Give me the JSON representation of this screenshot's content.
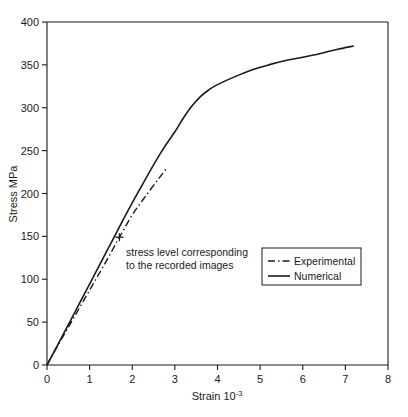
{
  "chart_data": {
    "type": "line",
    "title": "",
    "xlabel": "Strain 10-3",
    "xlabel_base": "Strain 10",
    "xlabel_exponent": "-3",
    "ylabel": "Stress MPa",
    "xlim": [
      0,
      8
    ],
    "ylim": [
      0,
      400
    ],
    "xticks": [
      "0",
      "1",
      "2",
      "3",
      "4",
      "5",
      "6",
      "7",
      "8"
    ],
    "xtick_values": [
      0,
      1,
      2,
      3,
      4,
      5,
      6,
      7,
      8
    ],
    "yticks": [
      "0",
      "50",
      "100",
      "150",
      "200",
      "250",
      "300",
      "350",
      "400"
    ],
    "ytick_values": [
      0,
      50,
      100,
      150,
      200,
      250,
      300,
      350,
      400
    ],
    "grid": false,
    "legend_position": "center-right",
    "series": [
      {
        "name": "Experimental",
        "style": "dash-dot",
        "color": "#1a1a1a",
        "x": [
          0,
          0.2,
          0.5,
          0.8,
          1.1,
          1.4,
          1.7,
          2.0,
          2.3,
          2.6,
          2.8
        ],
        "y": [
          0,
          18,
          44,
          70,
          96,
          122,
          149,
          175,
          196,
          216,
          229
        ]
      },
      {
        "name": "Numerical",
        "style": "solid",
        "color": "#1a1a1a",
        "x": [
          0,
          0.3,
          0.7,
          1.1,
          1.5,
          1.9,
          2.3,
          2.7,
          3.0,
          3.2,
          3.4,
          3.6,
          3.8,
          4.0,
          4.4,
          4.8,
          5.2,
          5.6,
          6.0,
          6.4,
          6.8,
          7.2
        ],
        "y": [
          0,
          28,
          66,
          104,
          142,
          180,
          216,
          250,
          272,
          288,
          302,
          313,
          321,
          327,
          336,
          344,
          350,
          355,
          359,
          363,
          368,
          372
        ]
      }
    ],
    "annotations": [
      {
        "name": "stress-level-note",
        "line1": "stress level corresponding",
        "line2": "to the recorded images",
        "marker": "+",
        "marker_x": 1.7,
        "marker_y": 149
      }
    ]
  },
  "legend": {
    "entries": [
      {
        "label": "Experimental",
        "style": "dash-dot"
      },
      {
        "label": "Numerical",
        "style": "solid"
      }
    ]
  }
}
